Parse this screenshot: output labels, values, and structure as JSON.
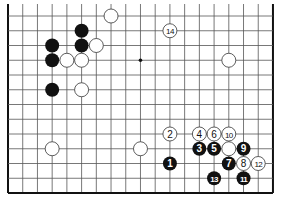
{
  "diagram": {
    "type": "go-board-fragment",
    "columns": 19,
    "rows_shown": 13,
    "borders": {
      "top": false,
      "left": true,
      "right": true,
      "bottom": true
    },
    "star_points": [
      {
        "col": 9,
        "row": 3
      }
    ],
    "stones": [
      {
        "color": "white",
        "col": 7,
        "row": 0,
        "label": ""
      },
      {
        "color": "black",
        "col": 5,
        "row": 1,
        "label": ""
      },
      {
        "color": "black",
        "col": 5,
        "row": 2,
        "label": ""
      },
      {
        "color": "white",
        "col": 6,
        "row": 2,
        "label": ""
      },
      {
        "color": "black",
        "col": 3,
        "row": 2,
        "label": ""
      },
      {
        "color": "black",
        "col": 3,
        "row": 3,
        "label": ""
      },
      {
        "color": "white",
        "col": 4,
        "row": 3,
        "label": ""
      },
      {
        "color": "white",
        "col": 5,
        "row": 3,
        "label": ""
      },
      {
        "color": "black",
        "col": 3,
        "row": 5,
        "label": ""
      },
      {
        "color": "white",
        "col": 5,
        "row": 5,
        "label": ""
      },
      {
        "color": "white",
        "col": 15,
        "row": 3,
        "label": ""
      },
      {
        "color": "white",
        "col": 11,
        "row": 1,
        "label": "14"
      },
      {
        "color": "white",
        "col": 3,
        "row": 9,
        "label": ""
      },
      {
        "color": "white",
        "col": 9,
        "row": 9,
        "label": ""
      },
      {
        "color": "white",
        "col": 11,
        "row": 8,
        "label": "2"
      },
      {
        "color": "white",
        "col": 13,
        "row": 8,
        "label": "4"
      },
      {
        "color": "white",
        "col": 14,
        "row": 8,
        "label": "6"
      },
      {
        "color": "white",
        "col": 15,
        "row": 8,
        "label": "10"
      },
      {
        "color": "black",
        "col": 13,
        "row": 9,
        "label": "3"
      },
      {
        "color": "black",
        "col": 14,
        "row": 9,
        "label": "5"
      },
      {
        "color": "white",
        "col": 15,
        "row": 9,
        "label": ""
      },
      {
        "color": "black",
        "col": 16,
        "row": 9,
        "label": "9"
      },
      {
        "color": "black",
        "col": 11,
        "row": 10,
        "label": "1"
      },
      {
        "color": "black",
        "col": 15,
        "row": 10,
        "label": "7"
      },
      {
        "color": "white",
        "col": 16,
        "row": 10,
        "label": "8"
      },
      {
        "color": "white",
        "col": 17,
        "row": 10,
        "label": "12"
      },
      {
        "color": "black",
        "col": 14,
        "row": 11,
        "label": "13"
      },
      {
        "color": "black",
        "col": 16,
        "row": 11,
        "label": "11"
      }
    ],
    "colors": {
      "grid": "#555555",
      "border": "#111111",
      "black_stone": "#111111",
      "white_stone": "#ffffff",
      "white_stone_outline": "#333333"
    }
  }
}
